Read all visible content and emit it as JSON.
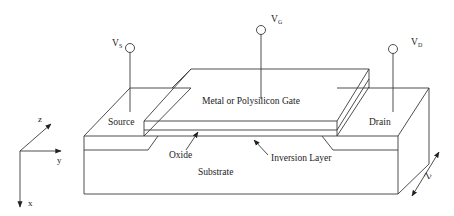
{
  "diagram": {
    "colors": {
      "line": "#3a3a3a",
      "text": "#222222",
      "background": "#ffffff"
    },
    "terminals": [
      {
        "id": "source",
        "symbol": "V",
        "subscript": "S"
      },
      {
        "id": "gate",
        "symbol": "V",
        "subscript": "G"
      },
      {
        "id": "drain",
        "symbol": "V",
        "subscript": "D"
      }
    ],
    "labels": {
      "gate": "Metal or Polysilicon Gate",
      "source": "Source",
      "drain": "Drain",
      "oxide": "Oxide",
      "inversion_layer": "Inversion Layer",
      "substrate": "Substrate",
      "width_dimension": "Z"
    },
    "axes": {
      "z": "z",
      "y": "y",
      "x": "x"
    }
  }
}
